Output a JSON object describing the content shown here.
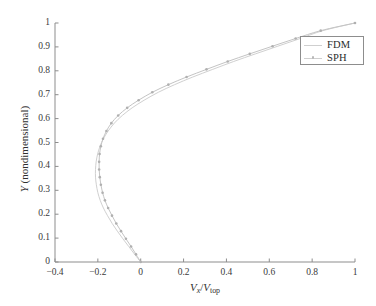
{
  "chart_data": {
    "type": "line",
    "title": "",
    "xlabel": "Vx/Vtop",
    "ylabel": "Y (nondimensional)",
    "xlim": [
      -0.4,
      1.0
    ],
    "ylim": [
      0.0,
      1.0
    ],
    "grid": false,
    "legend_position": "upper-right",
    "xticks": [
      "-0.4",
      "-0.2",
      "0",
      "0.2",
      "0.4",
      "0.6",
      "0.8",
      "1"
    ],
    "xtick_values": [
      -0.4,
      -0.2,
      0,
      0.2,
      0.4,
      0.6,
      0.8,
      1
    ],
    "yticks": [
      "0",
      "0.1",
      "0.2",
      "0.3",
      "0.4",
      "0.5",
      "0.6",
      "0.7",
      "0.8",
      "0.9",
      "1"
    ],
    "ytick_values": [
      0,
      0.1,
      0.2,
      0.3,
      0.4,
      0.5,
      0.6,
      0.7,
      0.8,
      0.9,
      1
    ],
    "series": [
      {
        "name": "FDM",
        "style": "solid-line",
        "color": "#d0d0d0",
        "marker": "none",
        "x": [
          0.0,
          -0.028,
          -0.056,
          -0.083,
          -0.109,
          -0.133,
          -0.155,
          -0.174,
          -0.189,
          -0.2,
          -0.207,
          -0.211,
          -0.211,
          -0.208,
          -0.201,
          -0.19,
          -0.174,
          -0.152,
          -0.123,
          -0.086,
          -0.04,
          0.016,
          0.082,
          0.158,
          0.243,
          0.336,
          0.434,
          0.536,
          0.64,
          0.744,
          0.85,
          1.0
        ],
        "y": [
          0.0,
          0.032,
          0.065,
          0.097,
          0.129,
          0.161,
          0.194,
          0.226,
          0.258,
          0.29,
          0.323,
          0.355,
          0.387,
          0.419,
          0.452,
          0.484,
          0.516,
          0.548,
          0.581,
          0.613,
          0.645,
          0.677,
          0.71,
          0.742,
          0.774,
          0.806,
          0.839,
          0.871,
          0.903,
          0.935,
          0.968,
          1.0
        ]
      },
      {
        "name": "SPH",
        "style": "line-with-markers",
        "color": "#c4c4c4",
        "marker": "dot",
        "marker_color": "#b0b0b0",
        "x": [
          0.0,
          -0.022,
          -0.045,
          -0.069,
          -0.092,
          -0.114,
          -0.134,
          -0.152,
          -0.167,
          -0.178,
          -0.186,
          -0.191,
          -0.194,
          -0.194,
          -0.192,
          -0.186,
          -0.176,
          -0.16,
          -0.137,
          -0.105,
          -0.063,
          -0.01,
          0.054,
          0.129,
          0.214,
          0.307,
          0.406,
          0.509,
          0.615,
          0.723,
          0.84,
          1.0
        ],
        "y": [
          0.0,
          0.032,
          0.065,
          0.097,
          0.129,
          0.161,
          0.194,
          0.226,
          0.258,
          0.29,
          0.323,
          0.355,
          0.387,
          0.419,
          0.452,
          0.484,
          0.516,
          0.548,
          0.581,
          0.613,
          0.645,
          0.677,
          0.71,
          0.742,
          0.774,
          0.806,
          0.839,
          0.871,
          0.903,
          0.935,
          0.968,
          1.0
        ]
      }
    ]
  },
  "axes": {
    "x_title_parts": {
      "v1": "V",
      "sub1": "x",
      "slash": "/",
      "v2": "V",
      "sub2": "top"
    },
    "y_title": "Y (nondimensional)",
    "y_title_var": "Y",
    "y_title_rest": " (nondimensional)"
  },
  "legend": {
    "entries": [
      {
        "label": "FDM"
      },
      {
        "label": "SPH"
      }
    ]
  },
  "colors": {
    "axis": "#8d8d8d",
    "tick_text": "#3a3a3a",
    "fdm": "#d0d0d0",
    "sph": "#c4c4c4",
    "sph_marker": "#b0b0b0",
    "background": "#ffffff"
  }
}
